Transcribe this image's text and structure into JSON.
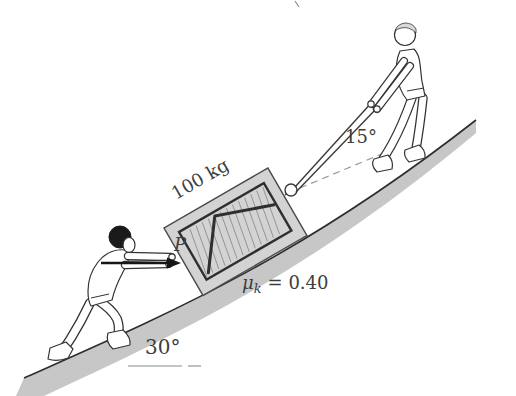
{
  "figure": {
    "type": "physics-incline-diagram",
    "description_visible_text_only": false,
    "labels": {
      "mass": "100 kg",
      "push_force": "P",
      "rope_angle": "15°",
      "incline_angle": "30°"
    },
    "friction": {
      "symbol": "μ",
      "subscript": "k",
      "value": "= 0.40"
    },
    "colors": {
      "line": "#2e2e2e",
      "crate_fill": "#d3d3d3",
      "ground_fill": "#c7c7c7",
      "crate_hatch": "#909090",
      "text": "#3d3d3d",
      "dashed_guide": "#9a9a9a",
      "pusher_hair": "#1a1a1a",
      "puller_hair": "#d8d8d8"
    }
  }
}
